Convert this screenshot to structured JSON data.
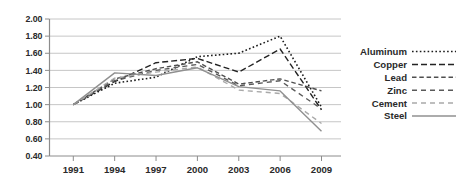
{
  "chart_data": {
    "type": "line",
    "title": "",
    "x": [
      1991,
      1994,
      1997,
      2000,
      2003,
      2006,
      2009
    ],
    "x_tick_labels": [
      "1991",
      "1994",
      "1997",
      "2000",
      "2003",
      "2006",
      "2009"
    ],
    "ylim": [
      0.4,
      2.0
    ],
    "y_tick_step": 0.2,
    "y_tick_labels": [
      "2.00",
      "1.80",
      "1.60",
      "1.40",
      "1.20",
      "1.00",
      "0.80",
      "0.60",
      "0.40"
    ],
    "grid": true,
    "legend_position": "right",
    "series": [
      {
        "name": "Aluminum",
        "color": "#1c1c1c",
        "style": "dotted",
        "values": [
          1.0,
          1.25,
          1.32,
          1.56,
          1.6,
          1.8,
          0.97
        ]
      },
      {
        "name": "Copper",
        "color": "#232323",
        "style": "dashed-long",
        "values": [
          1.0,
          1.27,
          1.49,
          1.54,
          1.38,
          1.65,
          0.94
        ]
      },
      {
        "name": "Lead",
        "color": "#4f4f4f",
        "style": "dashed",
        "values": [
          1.0,
          1.3,
          1.42,
          1.5,
          1.24,
          1.3,
          1.16
        ]
      },
      {
        "name": "Zinc",
        "color": "#5a5a5a",
        "style": "dashed-gap",
        "values": [
          1.0,
          1.28,
          1.4,
          1.47,
          1.22,
          1.28,
          0.95
        ]
      },
      {
        "name": "Cement",
        "color": "#a9a9a9",
        "style": "dashed-gap",
        "values": [
          1.0,
          1.31,
          1.38,
          1.44,
          1.17,
          1.13,
          0.78
        ]
      },
      {
        "name": "Steel",
        "color": "#909090",
        "style": "solid",
        "values": [
          1.0,
          1.37,
          1.34,
          1.43,
          1.21,
          1.16,
          0.69
        ]
      }
    ],
    "colors": {
      "grid": "#c6c6c6",
      "axis": "#8c8c8c",
      "text": "#2a2a2a",
      "background": "#ffffff"
    }
  }
}
